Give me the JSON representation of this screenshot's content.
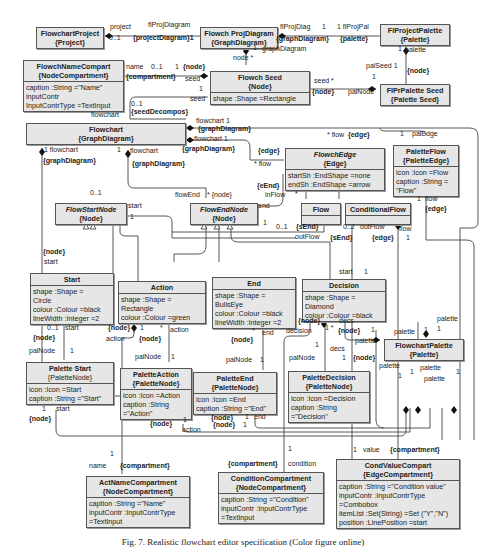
{
  "caption": "Fig. 7. Realistic flowchart editor specification (Color figure online)",
  "classes": {
    "flowchartProject": {
      "name": "FlowchartProject",
      "type": "{Project}"
    },
    "flowchProjDiagram": {
      "name": "Flowch ProjDiagram",
      "type": "{GraphDiagram}"
    },
    "flProjectPalette": {
      "name": "FlProjectPalette",
      "type": "{Palette}"
    },
    "flowchNameCompart": {
      "name": "FlowchNameCompart",
      "type": "{NodeCompartment}",
      "attrs": [
        "caption :String =\"Name\"",
        "inputContr",
        "InputContrType =TextInput"
      ]
    },
    "flowchSeed": {
      "name": "Flowch Seed",
      "type": "{Node}",
      "attrs": [
        "shape :Shape =Rectangle"
      ]
    },
    "flPrPaletteSeed": {
      "name": "FlPrPalette Seed",
      "type": "{Palette Seed}"
    },
    "flowchart": {
      "name": "Flowchart",
      "type": "{GraphDiagram}"
    },
    "flowchEdge": {
      "name": "FlowchEdge",
      "type": "{Edge}",
      "attrs": [
        "startSh :EndShape =none",
        "endSh :EndShape =arrow"
      ]
    },
    "paletteFlow": {
      "name": "PaletteFlow",
      "type": "{PaletteEdge}",
      "attrs": [
        "icon :Icon =Flow",
        "caption :String =",
        "\"Flow\""
      ]
    },
    "flowStartNode": {
      "name": "FlowStartNode",
      "type": "{Node}"
    },
    "flowEndNode": {
      "name": "FlowEndNode",
      "type": "{Node}"
    },
    "flow": {
      "name": "Flow"
    },
    "conditionalFlow": {
      "name": "ConditionalFlow"
    },
    "start": {
      "name": "Start",
      "attrs": [
        "shape :Shape =",
        "Circle",
        "colour :Colour =black",
        "lineWidth :Integer =2"
      ]
    },
    "action": {
      "name": "Action",
      "attrs": [
        "shape :Shape =",
        "Rectangle",
        "colour :Colour =green"
      ]
    },
    "end": {
      "name": "End",
      "attrs": [
        "shape :Shape =",
        "BullsEye",
        "colour :Colour =black",
        "lineWidth :Integer =2"
      ]
    },
    "decision": {
      "name": "Decision",
      "attrs": [
        "shape :Shape =",
        "Diamond",
        "colour :Colour =black"
      ]
    },
    "flowchartPalette": {
      "name": "FlowchartPalette",
      "type": "{Palette}"
    },
    "paletteStart": {
      "name": "Palette Start",
      "type": "{PaletteNode}",
      "attrs": [
        "icon :Icon =Start",
        "caption :String =\"Start\""
      ]
    },
    "paletteAction": {
      "name": "PaletteAction",
      "type": "{PaletteNode}",
      "attrs": [
        "icon :Icon =Action",
        "caption :String",
        "=\"Action\""
      ]
    },
    "paletteEnd": {
      "name": "PaletteEnd",
      "type": "{PaletteNode}",
      "attrs": [
        "icon :Icon =End",
        "caption :String =\"End\""
      ]
    },
    "paletteDecision": {
      "name": "PaletteDecision",
      "type": "{PaletteNode}",
      "attrs": [
        "icon :Icon =Decision",
        "caption :String",
        "=\"Decision\""
      ]
    },
    "actNameCompartment": {
      "name": "ActNameCompartment",
      "type": "{NodeCompartment}",
      "attrs": [
        "caption :String =\"Name\"",
        "inputContr :InputContrType",
        "=TextInput"
      ]
    },
    "conditionCompartment": {
      "name": "ConditionCompartment",
      "type": "{NodeCompartment}",
      "attrs": [
        "caption :String =\"Condition\"",
        "inputContr :InputContrType",
        "=TextInput"
      ]
    },
    "condValueCompart": {
      "name": "CondValueCompart",
      "type": "{EdgeCompartment}",
      "attrs": [
        "caption :String =\"Condition value\"",
        "inputContr :InputContrType",
        "=Combobox",
        "itemList :Set(String) =Set (\"Y\",\"N\")",
        "position :LinePosition =start"
      ]
    }
  },
  "labels": [
    {
      "t": "project",
      "x": 110,
      "y": 29
    },
    {
      "t": "0..1",
      "x": 109,
      "y": 40
    },
    {
      "t": "flProjDiagram",
      "x": 148,
      "y": 27
    },
    {
      "t": "{projectDiagram}1",
      "x": 133,
      "y": 40
    },
    {
      "t": "flProjDiag",
      "x": 280,
      "y": 29
    },
    {
      "t": "1",
      "x": 322,
      "y": 29
    },
    {
      "t": "1 flProjPal",
      "x": 337,
      "y": 29
    },
    {
      "t": "{graphDiagram}",
      "x": 276,
      "y": 41
    },
    {
      "t": "{palette}",
      "x": 340,
      "y": 41
    },
    {
      "t": "1",
      "x": 253,
      "y": 50
    },
    {
      "t": "graphDiagram",
      "x": 262,
      "y": 51
    },
    {
      "t": "node *",
      "x": 233,
      "y": 60
    },
    {
      "t": "1",
      "x": 398,
      "y": 51
    },
    {
      "t": "palette",
      "x": 405,
      "y": 52
    },
    {
      "t": "palSeed 1",
      "x": 366,
      "y": 68
    },
    {
      "t": "{node}",
      "x": 407,
      "y": 73
    },
    {
      "t": "1",
      "x": 372,
      "y": 79
    },
    {
      "t": "seed *",
      "x": 314,
      "y": 83
    },
    {
      "t": "{node}",
      "x": 312,
      "y": 94
    },
    {
      "t": "palNode",
      "x": 348,
      "y": 94
    },
    {
      "t": "name",
      "x": 126,
      "y": 69
    },
    {
      "t": "0..1",
      "x": 151,
      "y": 69
    },
    {
      "t": "1",
      "x": 175,
      "y": 69
    },
    {
      "t": "{node}",
      "x": 183,
      "y": 69
    },
    {
      "t": "{compartment}",
      "x": 126,
      "y": 79
    },
    {
      "t": "seed",
      "x": 185,
      "y": 81
    },
    {
      "t": "1",
      "x": 199,
      "y": 91
    },
    {
      "t": "seed",
      "x": 190,
      "y": 101
    },
    {
      "t": "0..1",
      "x": 131,
      "y": 106
    },
    {
      "t": "{seedDecompos}",
      "x": 131,
      "y": 114
    },
    {
      "t": "flowchart",
      "x": 91,
      "y": 117
    },
    {
      "t": "flowchart 1",
      "x": 196,
      "y": 123
    },
    {
      "t": "{graphDiagram}",
      "x": 198,
      "y": 131
    },
    {
      "t": "flowchart 1",
      "x": 194,
      "y": 141
    },
    {
      "t": "{graphDiagram}",
      "x": 182,
      "y": 151
    },
    {
      "t": "1 flowchart",
      "x": 44,
      "y": 152
    },
    {
      "t": "{graphDiagram}",
      "x": 43,
      "y": 163
    },
    {
      "t": "1",
      "x": 117,
      "y": 152
    },
    {
      "t": "flowchart",
      "x": 130,
      "y": 153
    },
    {
      "t": "{graphDiagram}",
      "x": 132,
      "y": 166
    },
    {
      "t": "{edge}",
      "x": 258,
      "y": 153
    },
    {
      "t": "* flow",
      "x": 254,
      "y": 166
    },
    {
      "t": "* flow",
      "x": 327,
      "y": 137
    },
    {
      "t": "{edge}",
      "x": 348,
      "y": 137
    },
    {
      "t": "1",
      "x": 400,
      "y": 136
    },
    {
      "t": "palEdge",
      "x": 412,
      "y": 136
    },
    {
      "t": "{eEnd}",
      "x": 257,
      "y": 188
    },
    {
      "t": "inFlow",
      "x": 265,
      "y": 197
    },
    {
      "t": "*",
      "x": 295,
      "y": 196
    },
    {
      "t": "end",
      "x": 258,
      "y": 208
    },
    {
      "t": "1",
      "x": 263,
      "y": 225
    },
    {
      "t": "0..1",
      "x": 276,
      "y": 229
    },
    {
      "t": "{sEnd}",
      "x": 296,
      "y": 229
    },
    {
      "t": "outFlow",
      "x": 295,
      "y": 239
    },
    {
      "t": "0..2",
      "x": 343,
      "y": 229
    },
    {
      "t": "outFlow",
      "x": 360,
      "y": 229
    },
    {
      "t": "{sEnd}",
      "x": 330,
      "y": 240
    },
    {
      "t": "{edge}",
      "x": 372,
      "y": 240
    },
    {
      "t": "flow",
      "x": 399,
      "y": 231
    },
    {
      "t": "1",
      "x": 406,
      "y": 240
    },
    {
      "t": "1",
      "x": 417,
      "y": 201
    },
    {
      "t": "flow",
      "x": 425,
      "y": 201
    },
    {
      "t": "{edge}",
      "x": 425,
      "y": 211
    },
    {
      "t": "0..1",
      "x": 90,
      "y": 195
    },
    {
      "t": "start",
      "x": 128,
      "y": 208
    },
    {
      "t": "1",
      "x": 130,
      "y": 219
    },
    {
      "t": "flowEnd",
      "x": 175,
      "y": 197
    },
    {
      "t": "* {node}",
      "x": 207,
      "y": 197
    },
    {
      "t": "{node}",
      "x": 43,
      "y": 254
    },
    {
      "t": "start",
      "x": 44,
      "y": 264
    },
    {
      "t": "0..1",
      "x": 47,
      "y": 330
    },
    {
      "t": "start",
      "x": 65,
      "y": 330
    },
    {
      "t": "{node}",
      "x": 33,
      "y": 340
    },
    {
      "t": "palNode",
      "x": 29,
      "y": 353
    },
    {
      "t": "1",
      "x": 70,
      "y": 353
    },
    {
      "t": "{node}",
      "x": 108,
      "y": 330
    },
    {
      "t": "action",
      "x": 106,
      "y": 341
    },
    {
      "t": "1",
      "x": 140,
      "y": 330
    },
    {
      "t": "*",
      "x": 160,
      "y": 330
    },
    {
      "t": "action",
      "x": 170,
      "y": 332
    },
    {
      "t": "{node}",
      "x": 139,
      "y": 341
    },
    {
      "t": "palNode",
      "x": 135,
      "y": 359
    },
    {
      "t": "1",
      "x": 171,
      "y": 359
    },
    {
      "t": "*",
      "x": 252,
      "y": 333
    },
    {
      "t": "end",
      "x": 262,
      "y": 335
    },
    {
      "t": "{node}",
      "x": 231,
      "y": 342
    },
    {
      "t": "palNode",
      "x": 226,
      "y": 362
    },
    {
      "t": "1",
      "x": 260,
      "y": 362
    },
    {
      "t": "start",
      "x": 339,
      "y": 274
    },
    {
      "t": "1",
      "x": 364,
      "y": 274
    },
    {
      "t": "{node}",
      "x": 298,
      "y": 323
    },
    {
      "t": "decision",
      "x": 286,
      "y": 333
    },
    {
      "t": "1 *",
      "x": 325,
      "y": 330
    },
    {
      "t": "decs",
      "x": 339,
      "y": 323
    },
    {
      "t": "{node}",
      "x": 338,
      "y": 333
    },
    {
      "t": "1",
      "x": 371,
      "y": 332
    },
    {
      "t": "1",
      "x": 315,
      "y": 347
    },
    {
      "t": "decs",
      "x": 330,
      "y": 351
    },
    {
      "t": "palNode",
      "x": 289,
      "y": 360
    },
    {
      "t": "1",
      "x": 342,
      "y": 360
    },
    {
      "t": "{node}",
      "x": 353,
      "y": 360
    },
    {
      "t": "palette",
      "x": 355,
      "y": 343
    },
    {
      "t": "palette",
      "x": 394,
      "y": 334
    },
    {
      "t": "1",
      "x": 424,
      "y": 332
    },
    {
      "t": "palette",
      "x": 437,
      "y": 321
    },
    {
      "t": "1",
      "x": 437,
      "y": 331
    },
    {
      "t": "palette",
      "x": 379,
      "y": 368
    },
    {
      "t": "1",
      "x": 398,
      "y": 378
    },
    {
      "t": "1",
      "x": 410,
      "y": 374
    },
    {
      "t": "palette",
      "x": 420,
      "y": 370
    },
    {
      "t": "palette",
      "x": 424,
      "y": 381
    },
    {
      "t": "1",
      "x": 456,
      "y": 374
    },
    {
      "t": "1",
      "x": 42,
      "y": 411
    },
    {
      "t": "start",
      "x": 56,
      "y": 411
    },
    {
      "t": "{node}",
      "x": 29,
      "y": 421
    },
    {
      "t": "{node}",
      "x": 150,
      "y": 426
    },
    {
      "t": "1",
      "x": 183,
      "y": 422
    },
    {
      "t": "action",
      "x": 182,
      "y": 432
    },
    {
      "t": "{node}",
      "x": 213,
      "y": 427
    },
    {
      "t": "1",
      "x": 243,
      "y": 427
    },
    {
      "t": "1",
      "x": 245,
      "y": 419
    },
    {
      "t": "end",
      "x": 254,
      "y": 419
    },
    {
      "t": "{node}",
      "x": 211,
      "y": 420
    },
    {
      "t": "1",
      "x": 110,
      "y": 456
    },
    {
      "t": "name",
      "x": 89,
      "y": 468
    },
    {
      "t": "{compartment}",
      "x": 120,
      "y": 468
    },
    {
      "t": "{compartment}",
      "x": 228,
      "y": 466
    },
    {
      "t": "1",
      "x": 288,
      "y": 451
    },
    {
      "t": "condition",
      "x": 288,
      "y": 466
    },
    {
      "t": "1",
      "x": 353,
      "y": 452
    },
    {
      "t": "value",
      "x": 363,
      "y": 452
    },
    {
      "t": "{compartment}",
      "x": 390,
      "y": 452
    }
  ]
}
